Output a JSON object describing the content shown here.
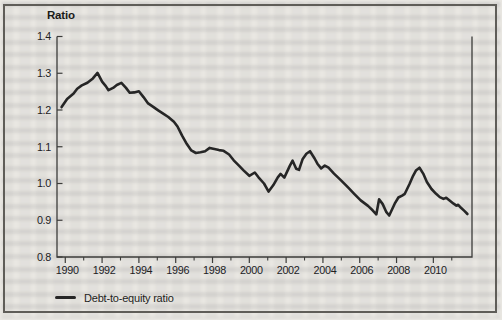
{
  "figure": {
    "axis_title": "Ratio",
    "legend_label": "Debt-to-equity ratio",
    "paper_color": "#e9e7e2",
    "frame_color": "#5f5d58"
  },
  "chart_data": {
    "type": "line",
    "title": "Ratio",
    "xlabel": "",
    "ylabel": "Ratio",
    "xlim": [
      1989.55,
      2012.1
    ],
    "ylim": [
      0.8,
      1.4
    ],
    "grid": false,
    "legend_position": "bottom-left",
    "line_color": "#262626",
    "axis_color": "#3c3c3a",
    "y_ticks": [
      0.8,
      0.9,
      1.0,
      1.1,
      1.2,
      1.3,
      1.4
    ],
    "y_tick_labels": [
      "0.8",
      "0.9",
      "1.0",
      "1.1",
      "1.2",
      "1.3",
      "1.4"
    ],
    "x_ticks": [
      1990,
      1992,
      1994,
      1996,
      1998,
      2000,
      2002,
      2004,
      2006,
      2008,
      2010
    ],
    "x_tick_labels": [
      "1990",
      "1992",
      "1994",
      "1996",
      "1998",
      "2000",
      "2002",
      "2004",
      "2006",
      "2008",
      "2010"
    ],
    "x_ticks_minor": [
      1991,
      1993,
      1995,
      1997,
      1999,
      2001,
      2003,
      2005,
      2007,
      2009,
      2011
    ],
    "series": [
      {
        "name": "Debt-to-equity ratio",
        "points": [
          [
            1989.8,
            1.208
          ],
          [
            1990.1,
            1.23
          ],
          [
            1990.45,
            1.245
          ],
          [
            1990.65,
            1.258
          ],
          [
            1990.9,
            1.267
          ],
          [
            1991.2,
            1.274
          ],
          [
            1991.5,
            1.286
          ],
          [
            1991.75,
            1.301
          ],
          [
            1992.0,
            1.277
          ],
          [
            1992.2,
            1.265
          ],
          [
            1992.35,
            1.254
          ],
          [
            1992.6,
            1.26
          ],
          [
            1992.8,
            1.268
          ],
          [
            1993.05,
            1.274
          ],
          [
            1993.3,
            1.26
          ],
          [
            1993.5,
            1.247
          ],
          [
            1993.75,
            1.248
          ],
          [
            1994.0,
            1.251
          ],
          [
            1994.25,
            1.235
          ],
          [
            1994.5,
            1.218
          ],
          [
            1994.8,
            1.208
          ],
          [
            1995.05,
            1.199
          ],
          [
            1995.3,
            1.191
          ],
          [
            1995.6,
            1.181
          ],
          [
            1995.9,
            1.168
          ],
          [
            1996.1,
            1.155
          ],
          [
            1996.35,
            1.13
          ],
          [
            1996.6,
            1.108
          ],
          [
            1996.85,
            1.09
          ],
          [
            1997.1,
            1.083
          ],
          [
            1997.35,
            1.085
          ],
          [
            1997.6,
            1.088
          ],
          [
            1997.85,
            1.097
          ],
          [
            1998.1,
            1.094
          ],
          [
            1998.35,
            1.091
          ],
          [
            1998.6,
            1.089
          ],
          [
            1998.9,
            1.079
          ],
          [
            1999.15,
            1.063
          ],
          [
            1999.45,
            1.048
          ],
          [
            1999.7,
            1.035
          ],
          [
            2000.0,
            1.021
          ],
          [
            2000.3,
            1.03
          ],
          [
            2000.5,
            1.017
          ],
          [
            2000.8,
            1.0
          ],
          [
            2001.05,
            0.978
          ],
          [
            2001.3,
            0.995
          ],
          [
            2001.55,
            1.017
          ],
          [
            2001.7,
            1.026
          ],
          [
            2001.9,
            1.016
          ],
          [
            2002.2,
            1.048
          ],
          [
            2002.35,
            1.062
          ],
          [
            2002.55,
            1.04
          ],
          [
            2002.7,
            1.037
          ],
          [
            2002.9,
            1.067
          ],
          [
            2003.1,
            1.081
          ],
          [
            2003.3,
            1.088
          ],
          [
            2003.55,
            1.068
          ],
          [
            2003.7,
            1.054
          ],
          [
            2003.9,
            1.041
          ],
          [
            2004.1,
            1.049
          ],
          [
            2004.3,
            1.043
          ],
          [
            2004.6,
            1.027
          ],
          [
            2005.0,
            1.008
          ],
          [
            2005.35,
            0.99
          ],
          [
            2005.7,
            0.972
          ],
          [
            2006.05,
            0.954
          ],
          [
            2006.45,
            0.939
          ],
          [
            2006.7,
            0.927
          ],
          [
            2006.9,
            0.916
          ],
          [
            2007.05,
            0.957
          ],
          [
            2007.25,
            0.944
          ],
          [
            2007.45,
            0.922
          ],
          [
            2007.6,
            0.913
          ],
          [
            2007.9,
            0.945
          ],
          [
            2008.1,
            0.962
          ],
          [
            2008.3,
            0.967
          ],
          [
            2008.45,
            0.972
          ],
          [
            2008.7,
            0.998
          ],
          [
            2008.9,
            1.021
          ],
          [
            2009.05,
            1.035
          ],
          [
            2009.25,
            1.043
          ],
          [
            2009.45,
            1.027
          ],
          [
            2009.65,
            1.004
          ],
          [
            2009.9,
            0.985
          ],
          [
            2010.15,
            0.972
          ],
          [
            2010.35,
            0.963
          ],
          [
            2010.55,
            0.958
          ],
          [
            2010.7,
            0.961
          ],
          [
            2010.9,
            0.953
          ],
          [
            2011.1,
            0.945
          ],
          [
            2011.25,
            0.94
          ],
          [
            2011.35,
            0.942
          ],
          [
            2011.5,
            0.934
          ],
          [
            2011.7,
            0.925
          ],
          [
            2011.85,
            0.917
          ]
        ]
      }
    ]
  }
}
